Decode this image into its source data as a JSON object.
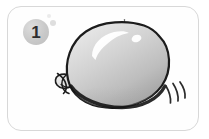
{
  "panel": {
    "kind": "instruction-step-panel",
    "step_number": "1",
    "frame_color": "#d8d8d8",
    "background_color": "#ffffff",
    "badge_color": "#c9c9c9",
    "badge_text_color": "#2e2e2e"
  },
  "illustration": {
    "subject": "inflated balloon",
    "description": "A large inflated gray balloon with a tied knot at its lower-left neck, a glossy white highlight on the upper left, a dark shadow along the bottom, a small tick mark at the top, and three short motion lines at the lower right indicating movement.",
    "balloon": {
      "fill_light": "#e2e2e2",
      "fill_mid": "#c6c6c6",
      "fill_shadow": "#9e9e9e",
      "outline_color": "#1c1c1c",
      "highlight_color": "#ffffff"
    },
    "knot": {
      "label": "balloon knot",
      "fill": "#e8e8e8",
      "outline_color": "#1c1c1c"
    },
    "motion_lines": {
      "label": "motion lines",
      "count": "3",
      "color": "#2b2b2b"
    },
    "top_mark": {
      "label": "top tick mark",
      "color": "#6a6a6a"
    }
  },
  "decorations": {
    "bubbles": [
      {
        "name": "bubble-small",
        "color": "#ebebeb"
      },
      {
        "name": "bubble-medium",
        "color": "#dedede"
      }
    ]
  }
}
